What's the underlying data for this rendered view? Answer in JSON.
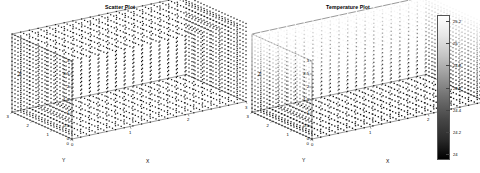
{
  "figure": {
    "background_color": "#ffffff",
    "marker_color": "#1a1a1a",
    "axis_color": "#000000"
  },
  "panels": [
    {
      "id": "scatter-plot",
      "title": "Scatter Plot",
      "axes": {
        "x": {
          "label": "X",
          "ticks": [
            "0",
            "1",
            "2",
            "3"
          ]
        },
        "y": {
          "label": "Y",
          "ticks": [
            "0",
            "1",
            "2",
            "3"
          ]
        },
        "z": {
          "label": "Z",
          "ticks": [
            "0",
            "0.5",
            "1",
            "1.5",
            "2",
            "2.5",
            "3"
          ]
        }
      }
    },
    {
      "id": "temperature-plot",
      "title": "Temperature Plot",
      "axes": {
        "x": {
          "label": "X",
          "ticks": [
            "0",
            "1",
            "2",
            "3"
          ]
        },
        "y": {
          "label": "Y",
          "ticks": [
            "0",
            "1",
            "2",
            "3"
          ]
        },
        "z": {
          "label": "Z",
          "ticks": [
            "0",
            "0.5",
            "1",
            "1.5",
            "2",
            "2.5",
            "3"
          ]
        }
      },
      "colorbar": {
        "ticks": [
          "25.2",
          "25",
          "24.8",
          "24.6",
          "24.4",
          "24.2",
          "24"
        ],
        "min": "24",
        "max": "25.2",
        "colormap_low": "#000000",
        "colormap_high": "#ffffff"
      }
    }
  ],
  "chart_data": [
    {
      "type": "scatter",
      "title": "Scatter Plot",
      "projection": "3d",
      "xlabel": "X",
      "ylabel": "Y",
      "zlabel": "Z",
      "xlim": [
        0,
        3
      ],
      "ylim": [
        0,
        3
      ],
      "zlim": [
        0,
        3
      ],
      "xticks": [
        0,
        1,
        2,
        3
      ],
      "yticks": [
        0,
        1,
        2,
        3
      ],
      "zticks": [
        0,
        0.5,
        1,
        1.5,
        2,
        2.5,
        3
      ],
      "grid": false,
      "legend": null,
      "marker": "square",
      "marker_color": "#1a1a1a",
      "description": "Dense uniform 3D lattice of point markers filling a cube from 0 to 3 on each axis",
      "grid_spacing": 0.15,
      "points_per_axis": 21,
      "total_points": 9261
    },
    {
      "type": "scatter",
      "title": "Temperature Plot",
      "projection": "3d",
      "xlabel": "X",
      "ylabel": "Y",
      "zlabel": "Z",
      "xlim": [
        0,
        3
      ],
      "ylim": [
        0,
        3
      ],
      "zlim": [
        0,
        3
      ],
      "xticks": [
        0,
        1,
        2,
        3
      ],
      "yticks": [
        0,
        1,
        2,
        3
      ],
      "zticks": [
        0,
        0.5,
        1,
        1.5,
        2,
        2.5,
        3
      ],
      "grid": false,
      "legend": null,
      "colormap": "gray",
      "colorbar_label": "",
      "colorbar_ticks": [
        24,
        24.2,
        24.4,
        24.6,
        24.8,
        25,
        25.2
      ],
      "colorbar_range": [
        24,
        25.2
      ],
      "description": "Same 3D lattice of markers colored by temperature value, grayscale, brighter (higher temperature) toward the top of the cube",
      "value_min": 24,
      "value_max": 25.2,
      "value_unit": "degrees",
      "gradient_direction": "increases with Z"
    }
  ]
}
